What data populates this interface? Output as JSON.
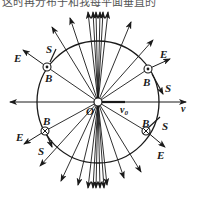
{
  "caption_fragment": "这时再分布于和我每平面垂直的",
  "figure": {
    "center_label": "O",
    "axis_label_right": "v",
    "velocity_label": "v0",
    "velocity_label_sub": "0",
    "velocity_label_main": "v",
    "circle": {
      "cx": 98,
      "cy": 102,
      "r": 61
    },
    "markers": [
      {
        "id": "upper-left",
        "B": "B",
        "E": "E",
        "S": "S",
        "field": "out-of-page"
      },
      {
        "id": "upper-right",
        "B": "B",
        "E": "E",
        "S": "S",
        "field": "out-of-page"
      },
      {
        "id": "lower-left",
        "B": "B",
        "E": "E",
        "S": "S",
        "field": "into-page"
      },
      {
        "id": "lower-right",
        "B": "B",
        "E": "E",
        "S": "S",
        "field": "into-page"
      }
    ],
    "colors": {
      "line": "#1a1a1a",
      "background": "#ffffff"
    }
  }
}
